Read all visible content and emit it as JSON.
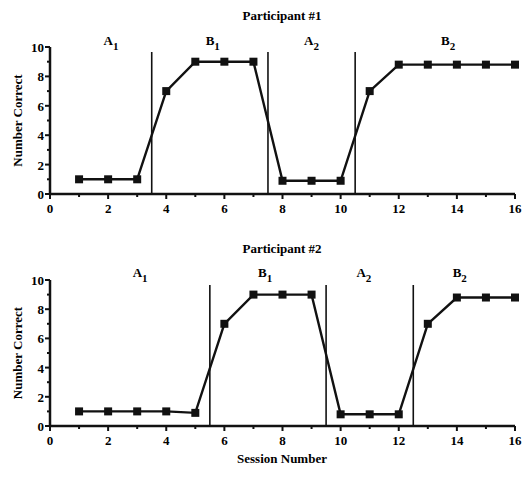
{
  "chart_data": [
    {
      "type": "line",
      "title": "Participant #1",
      "xlabel": "",
      "ylabel": "Number Correct",
      "xlim": [
        0,
        16
      ],
      "ylim": [
        0,
        10
      ],
      "xticks": [
        0,
        2,
        4,
        6,
        8,
        10,
        12,
        14,
        16
      ],
      "yticks": [
        0,
        2,
        4,
        6,
        8,
        10
      ],
      "grid": false,
      "x": [
        1,
        2,
        3,
        4,
        5,
        6,
        7,
        8,
        9,
        10,
        11,
        12,
        13,
        14,
        15,
        16
      ],
      "series": [
        {
          "name": "Number Correct",
          "values": [
            1,
            1,
            1,
            7,
            9,
            9,
            9,
            0.9,
            0.9,
            0.9,
            7,
            8.8,
            8.8,
            8.8,
            8.8,
            8.8
          ]
        }
      ],
      "phase_lines": [
        3.5,
        7.5,
        10.5
      ],
      "phase_labels": [
        {
          "label": "A",
          "sub": "1",
          "x": 2.1
        },
        {
          "label": "B",
          "sub": "1",
          "x": 5.6
        },
        {
          "label": "A",
          "sub": "2",
          "x": 9.0
        },
        {
          "label": "B",
          "sub": "2",
          "x": 13.7
        }
      ]
    },
    {
      "type": "line",
      "title": "Participant #2",
      "xlabel": "Session Number",
      "ylabel": "Number Correct",
      "xlim": [
        0,
        16
      ],
      "ylim": [
        0,
        10
      ],
      "xticks": [
        0,
        2,
        4,
        6,
        8,
        10,
        12,
        14,
        16
      ],
      "yticks": [
        0,
        2,
        4,
        6,
        8,
        10
      ],
      "grid": false,
      "x": [
        1,
        2,
        3,
        4,
        5,
        6,
        7,
        8,
        9,
        10,
        11,
        12,
        13,
        14,
        15,
        16
      ],
      "series": [
        {
          "name": "Number Correct",
          "values": [
            1,
            1,
            1,
            1,
            0.9,
            7,
            9,
            9,
            9,
            0.8,
            0.8,
            0.8,
            7,
            8.8,
            8.8,
            8.8
          ]
        }
      ],
      "phase_lines": [
        5.5,
        9.5,
        12.5
      ],
      "phase_labels": [
        {
          "label": "A",
          "sub": "1",
          "x": 3.1
        },
        {
          "label": "B",
          "sub": "1",
          "x": 7.4
        },
        {
          "label": "A",
          "sub": "2",
          "x": 10.8
        },
        {
          "label": "B",
          "sub": "2",
          "x": 14.1
        }
      ]
    }
  ]
}
